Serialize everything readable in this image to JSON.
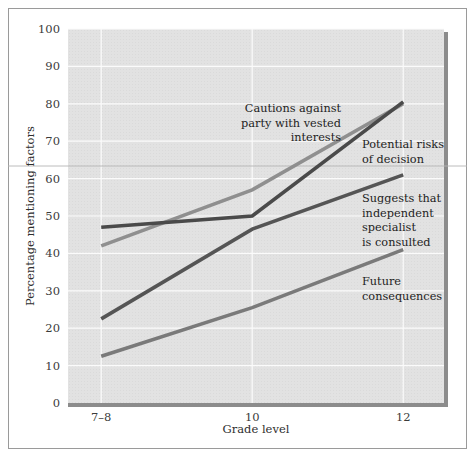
{
  "figure": {
    "background_color": "#ffffff",
    "panel_color": "#e2e2e2",
    "frame_color": "#9a9a9a",
    "gridline_color": "#fbfbfb",
    "axis_shadow_color": "#8c8c8c"
  },
  "chart_data": {
    "type": "line",
    "title": "",
    "subtitle": "",
    "xlabel": "Grade level",
    "ylabel": "Percentage mentioning factors",
    "categories": [
      "7–8",
      "10",
      "12"
    ],
    "x": [
      0,
      1,
      2
    ],
    "xtick_labels": [
      "7–8",
      "10",
      "12"
    ],
    "ytick_labels": [
      "0",
      "10",
      "20",
      "30",
      "40",
      "50",
      "60",
      "70",
      "80",
      "90",
      "100"
    ],
    "yticks": [
      0,
      10,
      20,
      30,
      40,
      50,
      60,
      70,
      80,
      90,
      100
    ],
    "ylim": [
      0,
      100
    ],
    "xlim": [
      -0.22,
      2.27
    ],
    "grid": true,
    "grid_axis": "both",
    "legend": "none",
    "legend_position": "inline-annotations",
    "series": [
      {
        "name": "Cautions against party with vested interests",
        "color": "#8f8f8f",
        "line_width": 3.6,
        "values": [
          42,
          57,
          80
        ]
      },
      {
        "name": "Potential risks of decision",
        "color": "#4a4a4a",
        "line_width": 3.6,
        "values": [
          47,
          50,
          80.5
        ]
      },
      {
        "name": "Suggests that independent specialist is consulted",
        "color": "#555555",
        "line_width": 3.6,
        "values": [
          22.5,
          46.5,
          61
        ]
      },
      {
        "name": "Future consequences",
        "color": "#7a7a7a",
        "line_width": 3.6,
        "values": [
          12.5,
          25.5,
          41
        ]
      }
    ],
    "annotations": [
      {
        "id": "anno-cautions",
        "lines": [
          "Cautions against",
          "party with vested",
          "interests"
        ],
        "align": "end",
        "x": 341,
        "y": 112
      },
      {
        "id": "anno-potential-risks",
        "lines": [
          "Potential risks",
          "of decision"
        ],
        "align": "start",
        "x": 362,
        "y": 148
      },
      {
        "id": "anno-suggests-specialist",
        "lines": [
          "Suggests that",
          "independent",
          "specialist",
          "is consulted"
        ],
        "align": "start",
        "x": 362,
        "y": 202
      },
      {
        "id": "anno-future-consequences",
        "lines": [
          "Future",
          "consequences"
        ],
        "align": "start",
        "x": 362,
        "y": 285
      }
    ]
  }
}
